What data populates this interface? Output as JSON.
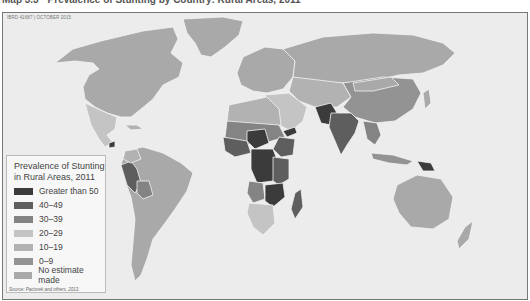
{
  "header": {
    "title": "Map 3.3 · Prevalence of Stunting by Country: Rural Areas, 2011",
    "map_code": "IBRD 41687 | OCTOBER 2015"
  },
  "legend": {
    "title": "Prevalence of Stunting in Rural Areas, 2011",
    "items": [
      {
        "label": "Greater than 50",
        "color": "#3b3b3b"
      },
      {
        "label": "40–49",
        "color": "#5e5e5e"
      },
      {
        "label": "30–39",
        "color": "#848484"
      },
      {
        "label": "20–29",
        "color": "#c4c4c4"
      },
      {
        "label": "10–19",
        "color": "#b2b2b2"
      },
      {
        "label": "0–9",
        "color": "#939393"
      },
      {
        "label": "No estimate made",
        "color": "#a9a9a9"
      }
    ]
  },
  "source": "Source: Paciorek and others, 2013.",
  "colors": {
    "ocean": "#ececec",
    "border": "#f4f4f4",
    "frame": "#777777"
  }
}
